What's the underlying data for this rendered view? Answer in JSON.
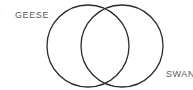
{
  "figure": {
    "type": "venn-diagram",
    "background_color": "#ffffff",
    "stroke_color": "#2b2b2b",
    "label_color": "#5c5c5c",
    "sets": [
      {
        "id": "left",
        "label": "GEESE",
        "label_position": "top-left",
        "center_x": 88,
        "center_y": 46,
        "radius": 41
      },
      {
        "id": "right",
        "label": "SWANS",
        "label_position": "bottom-right",
        "label_clipped": true,
        "center_x": 122,
        "center_y": 46,
        "radius": 41
      }
    ],
    "intersections": [
      {
        "x": 105,
        "y": 8
      },
      {
        "x": 105,
        "y": 83
      }
    ]
  }
}
